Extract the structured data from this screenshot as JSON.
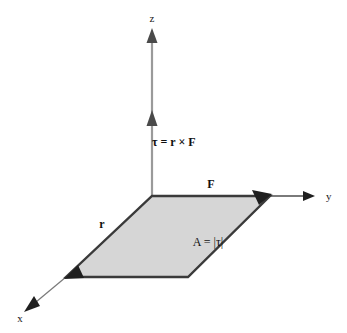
{
  "figure": {
    "background_color": "#ffffff"
  },
  "axes": [
    {
      "name": "z",
      "label": "z",
      "direction": "up",
      "label_x": 152,
      "label_y": 22,
      "line": {
        "x1": 152,
        "y1": 196,
        "x2": 152,
        "y2": 32
      },
      "color": "#999999",
      "arrow_color": "#555555"
    },
    {
      "name": "y",
      "label": "y",
      "direction": "right",
      "label_x": 330,
      "label_y": 199,
      "line": {
        "x1": 270,
        "y1": 196,
        "x2": 313,
        "y2": 196
      },
      "color": "#555555",
      "arrow_color": "#222222"
    },
    {
      "name": "x",
      "label": "x",
      "direction": "down-left",
      "label_x": 20,
      "label_y": 319,
      "line": {
        "x1": 66,
        "y1": 277,
        "x2": 32,
        "y2": 305
      },
      "color": "#777777",
      "arrow_color": "#222222"
    }
  ],
  "parallelogram": {
    "name": "area-parallelogram",
    "fill_color": "#d6d6d6",
    "stroke_color": "#3a3a3a",
    "points": "152,196 270,196 188,277 66,277",
    "vertices": {
      "origin": {
        "x": 152,
        "y": 196
      },
      "force_tip": {
        "x": 270,
        "y": 196
      },
      "far_corner": {
        "x": 188,
        "y": 277
      },
      "radius_tip": {
        "x": 66,
        "y": 277
      }
    }
  },
  "vectors": [
    {
      "name": "torque",
      "label": "τ = r × F",
      "label_x": 152,
      "label_y": 146,
      "arrow_tip_x": 152,
      "arrow_tip_y": 113,
      "color": "#555555"
    },
    {
      "name": "force",
      "label": "F",
      "label_x": 211,
      "label_y": 188,
      "arrow_tip_x": 270,
      "arrow_tip_y": 196,
      "color": "#2a2a2a"
    },
    {
      "name": "radius",
      "label": "r",
      "label_x": 102,
      "label_y": 227,
      "arrow_tip_x": 66,
      "arrow_tip_y": 277,
      "color": "#2a2a2a"
    }
  ],
  "annotations": [
    {
      "name": "area-magnitude",
      "text": "A = |τ|",
      "x": 208,
      "y": 245
    }
  ]
}
